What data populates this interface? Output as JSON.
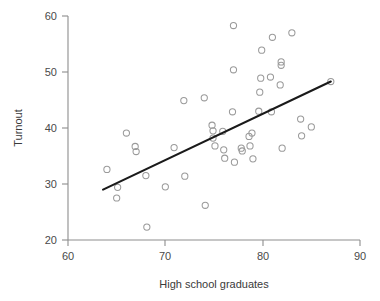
{
  "chart_data": {
    "type": "scatter",
    "title": "",
    "subtitle": "",
    "xlabel": "High school graduates",
    "ylabel": "Turnout",
    "xlim": [
      60,
      90
    ],
    "ylim": [
      20,
      60
    ],
    "xticks": [
      60,
      70,
      80,
      90
    ],
    "yticks": [
      20,
      30,
      40,
      50,
      60
    ],
    "xtick_labels": [
      "60",
      "70",
      "80",
      "90"
    ],
    "ytick_labels": [
      "20",
      "30",
      "40",
      "50",
      "60"
    ],
    "grid": false,
    "legend": "none",
    "marker": "open-circle",
    "marker_color": "#9a9a9a",
    "axis_color": "#8d8d8d",
    "line_color": "#1a1a1a",
    "background": "#ffffff",
    "annotations": [],
    "series": [
      {
        "name": "States",
        "type": "scatter",
        "points": [
          [
            64.0,
            32.6
          ],
          [
            65.0,
            27.5
          ],
          [
            65.1,
            29.4
          ],
          [
            66.0,
            39.1
          ],
          [
            66.9,
            36.7
          ],
          [
            67.0,
            35.8
          ],
          [
            68.0,
            31.5
          ],
          [
            68.1,
            22.3
          ],
          [
            70.0,
            29.5
          ],
          [
            70.9,
            36.5
          ],
          [
            71.9,
            44.9
          ],
          [
            72.0,
            31.4
          ],
          [
            74.0,
            45.4
          ],
          [
            74.1,
            26.2
          ],
          [
            74.8,
            40.5
          ],
          [
            74.9,
            39.5
          ],
          [
            74.9,
            38.2
          ],
          [
            75.1,
            36.8
          ],
          [
            75.9,
            39.4
          ],
          [
            76.0,
            36.1
          ],
          [
            76.1,
            34.6
          ],
          [
            76.9,
            42.9
          ],
          [
            77.0,
            50.4
          ],
          [
            77.0,
            58.3
          ],
          [
            77.1,
            33.9
          ],
          [
            77.8,
            36.4
          ],
          [
            77.9,
            35.9
          ],
          [
            78.6,
            38.5
          ],
          [
            78.7,
            36.8
          ],
          [
            78.9,
            39.1
          ],
          [
            79.0,
            34.5
          ],
          [
            79.6,
            43.0
          ],
          [
            79.7,
            46.4
          ],
          [
            79.8,
            48.9
          ],
          [
            79.9,
            53.9
          ],
          [
            80.8,
            49.1
          ],
          [
            80.9,
            42.9
          ],
          [
            81.0,
            56.2
          ],
          [
            81.8,
            47.7
          ],
          [
            81.9,
            51.8
          ],
          [
            81.9,
            51.2
          ],
          [
            82.0,
            36.4
          ],
          [
            83.0,
            57.0
          ],
          [
            83.9,
            41.6
          ],
          [
            84.0,
            38.6
          ],
          [
            85.0,
            40.2
          ],
          [
            87.0,
            48.3
          ]
        ]
      },
      {
        "name": "Linear fit",
        "type": "line",
        "endpoints": [
          [
            63.6,
            29.0
          ],
          [
            87.0,
            48.3
          ]
        ]
      }
    ]
  }
}
